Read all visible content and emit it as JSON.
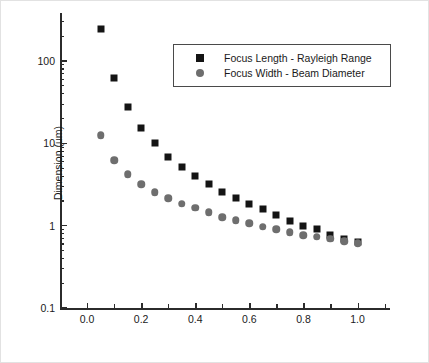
{
  "chart_data": {
    "type": "scatter",
    "title": "",
    "xlabel": "Numerical Aperture",
    "ylabel": "Dimension (um)",
    "xlim": [
      -0.1,
      1.12
    ],
    "ylim": [
      0.1,
      300
    ],
    "yscale": "log",
    "xscale": "linear",
    "grid": false,
    "legend_position": "upper-center",
    "x_ticks": [
      "0.0",
      "0.2",
      "0.4",
      "0.6",
      "0.8",
      "1.0"
    ],
    "x_tick_values": [
      0.0,
      0.2,
      0.4,
      0.6,
      0.8,
      1.0
    ],
    "x_minor_tick_values": [
      0.1,
      0.3,
      0.5,
      0.7,
      0.9,
      1.1
    ],
    "y_ticks": [
      "0.1",
      "1",
      "10",
      "100"
    ],
    "y_tick_values": [
      0.1,
      1,
      10,
      100
    ],
    "x": [
      0.05,
      0.1,
      0.15,
      0.2,
      0.25,
      0.3,
      0.35,
      0.4,
      0.45,
      0.5,
      0.55,
      0.6,
      0.65,
      0.7,
      0.75,
      0.8,
      0.85,
      0.9,
      0.95,
      1.0
    ],
    "series": [
      {
        "name": "Focus Length - Rayleigh Range",
        "marker": "square",
        "color": "#141414",
        "values": [
          245,
          62,
          27.5,
          15.5,
          10.0,
          6.9,
          5.1,
          4.0,
          3.2,
          2.6,
          2.2,
          1.85,
          1.6,
          1.35,
          1.15,
          1.0,
          0.9,
          0.78,
          0.68,
          0.63
        ]
      },
      {
        "name": "Focus Width - Beam Diameter",
        "marker": "circle",
        "color": "#6e6e6e",
        "values": [
          12.5,
          6.2,
          4.2,
          3.2,
          2.55,
          2.15,
          1.85,
          1.65,
          1.45,
          1.27,
          1.17,
          1.07,
          0.97,
          0.9,
          0.83,
          0.77,
          0.73,
          0.69,
          0.65,
          0.61
        ]
      }
    ]
  },
  "legend": {
    "items": [
      {
        "label": "Focus Length - Rayleigh Range",
        "marker": "square"
      },
      {
        "label": "Focus Width - Beam Diameter",
        "marker": "circle"
      }
    ]
  }
}
